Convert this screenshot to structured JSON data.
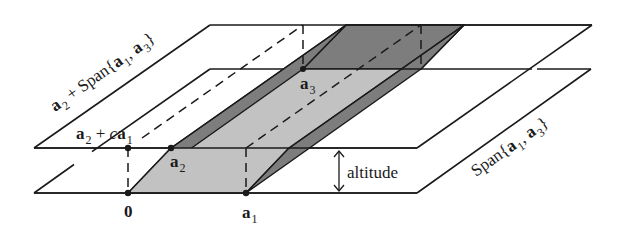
{
  "figure": {
    "colors": {
      "line": "#1a1a1a",
      "light_face": "#c2c2c2",
      "dark_face": "#7d7d7d",
      "background": "#ffffff"
    },
    "planes": {
      "upper": {
        "label_vec": "a",
        "label_sub": "2",
        "label_rest": " + Span{",
        "label_v1": "a",
        "label_s1": "1",
        "label_comma": ", ",
        "label_v3": "a",
        "label_s3": "3",
        "label_close": "}"
      },
      "lower": {
        "label_pre": "Span{",
        "label_v1": "a",
        "label_s1": "1",
        "label_comma": ", ",
        "label_v3": "a",
        "label_s3": "3",
        "label_close": "}"
      }
    },
    "points": {
      "origin": {
        "label": "0"
      },
      "a1": {
        "vec": "a",
        "sub": "1"
      },
      "a2": {
        "vec": "a",
        "sub": "2"
      },
      "a3": {
        "vec": "a",
        "sub": "3"
      },
      "a2_plus_ca1": {
        "vec": "a",
        "sub": "2",
        "mid": " + ",
        "coef": "c",
        "vec2": "a",
        "sub2": "1"
      }
    },
    "altitude": {
      "label": "altitude"
    }
  }
}
